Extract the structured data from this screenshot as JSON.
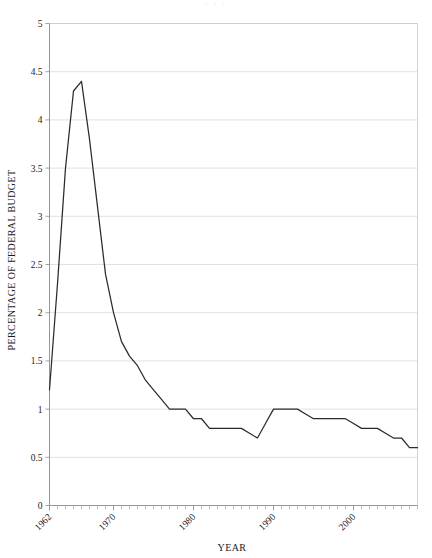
{
  "figure": {
    "ghost_header": ". . .",
    "background_color": "#ffffff",
    "line_color": "#2b2b2b",
    "grid_color": "#d9d9d9",
    "axis_color": "#8a8a8a"
  },
  "chart_data": {
    "type": "line",
    "title": "",
    "xlabel": "YEAR",
    "ylabel": "PERCENTAGE OF FEDERAL BUDGET",
    "xlim": [
      1962,
      2008
    ],
    "ylim": [
      0,
      5
    ],
    "ytick_values": [
      0,
      0.5,
      1,
      1.5,
      2,
      2.5,
      3,
      3.5,
      4,
      4.5,
      5
    ],
    "ytick_labels": [
      "0",
      "0.5",
      "1",
      "1.5",
      "2",
      "2.5",
      "3",
      "3.5",
      "4",
      "4.5",
      "5"
    ],
    "xtick_values": [
      1962,
      1970,
      1980,
      1990,
      2000
    ],
    "xtick_labels": [
      "1962",
      "1970",
      "1980",
      "1990",
      "2000"
    ],
    "xtick_rotation_deg": 45,
    "minor_xtick_step": 1,
    "grid": "horizontal",
    "legend": "none",
    "x": [
      1962,
      1963,
      1964,
      1965,
      1966,
      1967,
      1968,
      1969,
      1970,
      1971,
      1972,
      1973,
      1974,
      1975,
      1976,
      1977,
      1978,
      1979,
      1980,
      1981,
      1982,
      1983,
      1984,
      1985,
      1986,
      1987,
      1988,
      1989,
      1990,
      1991,
      1992,
      1993,
      1994,
      1995,
      1996,
      1997,
      1998,
      1999,
      2000,
      2001,
      2002,
      2003,
      2004,
      2005,
      2006,
      2007,
      2008
    ],
    "values": [
      1.2,
      2.3,
      3.5,
      4.3,
      4.4,
      3.8,
      3.1,
      2.4,
      2.0,
      1.7,
      1.55,
      1.45,
      1.3,
      1.2,
      1.1,
      1.0,
      1.0,
      1.0,
      0.9,
      0.9,
      0.8,
      0.8,
      0.8,
      0.8,
      0.8,
      0.75,
      0.7,
      0.85,
      1.0,
      1.0,
      1.0,
      1.0,
      0.95,
      0.9,
      0.9,
      0.9,
      0.9,
      0.9,
      0.85,
      0.8,
      0.8,
      0.8,
      0.75,
      0.7,
      0.7,
      0.6,
      0.6
    ],
    "series_name": "NASA budget as percentage of federal budget",
    "peak": {
      "year": 1966,
      "value": 4.4
    },
    "start": {
      "year": 1962,
      "value": 1.2
    },
    "end": {
      "year": 2008,
      "value": 0.6
    }
  }
}
